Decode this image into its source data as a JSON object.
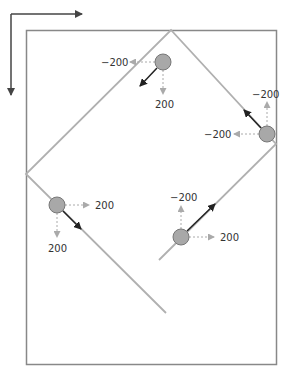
{
  "colors": {
    "box": "#888888",
    "path": "#b0b0b0",
    "ball_fill": "#a8a8a8",
    "ball_stroke": "#777777",
    "velocity": "#333333",
    "component": "#aaaaaa",
    "label": "#333333",
    "axis": "#444444"
  },
  "axes": {
    "x_direction": "right",
    "y_direction": "down"
  },
  "balls": [
    {
      "id": "top",
      "cx": 163,
      "cy": 62,
      "vx_label": "-200",
      "vy_label": "200"
    },
    {
      "id": "right",
      "cx": 267,
      "cy": 134,
      "vx_label": "-200",
      "vy_label": "-200"
    },
    {
      "id": "left",
      "cx": 57,
      "cy": 205,
      "vx_label": "200",
      "vy_label": "200"
    },
    {
      "id": "bottom",
      "cx": 181,
      "cy": 237,
      "vx_label": "200",
      "vy_label": "-200"
    }
  ]
}
